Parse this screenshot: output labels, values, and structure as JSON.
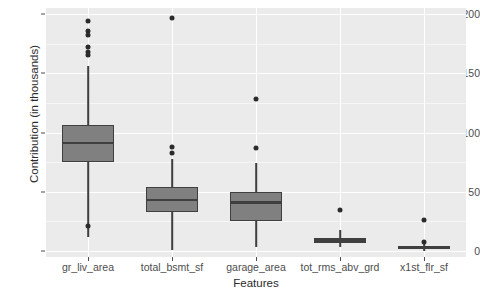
{
  "chart_data": {
    "type": "box",
    "title": "",
    "xlabel": "Features",
    "ylabel": "Contribution (in thousands)",
    "ylim": [
      -5,
      205
    ],
    "yticks": [
      0,
      50,
      100,
      150,
      200
    ],
    "ytick_labels": [
      "0",
      "50",
      "100",
      "150",
      "200"
    ],
    "y_minor_gridlines": [
      25,
      75,
      125,
      175
    ],
    "grid": true,
    "legend": "none",
    "panel_background": "#ebebeb",
    "box_fill": "#808080",
    "box_line": "#3f3f3f",
    "outlier_color": "#2b2b2b",
    "categories": [
      "gr_liv_area",
      "total_bsmt_sf",
      "garage_area",
      "tot_rms_abv_grd",
      "x1st_flr_sf"
    ],
    "boxes": [
      {
        "category": "gr_liv_area",
        "whisker_low": 12.0,
        "q1": 75.0,
        "median": 91.0,
        "q3": 106.0,
        "whisker_high": 156.0,
        "outliers": [
          194.0,
          186.0,
          182.0,
          172.0,
          168.0,
          165.0,
          21.0
        ]
      },
      {
        "category": "total_bsmt_sf",
        "whisker_low": 0.5,
        "q1": 33.0,
        "median": 43.0,
        "q3": 54.0,
        "whisker_high": 78.0,
        "outliers": [
          197.0,
          88.0,
          83.0
        ]
      },
      {
        "category": "garage_area",
        "whisker_low": 3.0,
        "q1": 25.0,
        "median": 41.0,
        "q3": 50.0,
        "whisker_high": 74.0,
        "outliers": [
          128.0,
          87.0
        ]
      },
      {
        "category": "tot_rms_abv_grd",
        "whisker_low": 3.0,
        "q1": 7.0,
        "median": 9.0,
        "q3": 11.0,
        "whisker_high": 18.0,
        "outliers": [
          35.0
        ]
      },
      {
        "category": "x1st_flr_sf",
        "whisker_low": 0.5,
        "q1": 1.5,
        "median": 2.5,
        "q3": 4.0,
        "whisker_high": 6.0,
        "outliers": [
          26.0,
          8.0
        ]
      }
    ]
  }
}
